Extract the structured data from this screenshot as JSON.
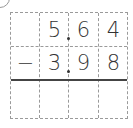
{
  "problem": {
    "label_marker": "",
    "operator": "−",
    "row1": [
      "",
      "5",
      "6",
      "4"
    ],
    "row2": [
      "−",
      "3",
      "9",
      "8"
    ],
    "row3": [
      "",
      "",
      "",
      ""
    ],
    "decimal_after_column": 1
  }
}
